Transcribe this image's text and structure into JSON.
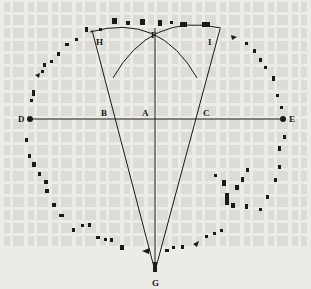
{
  "diagram": {
    "type": "geometric construction over stone circle",
    "points": {
      "A": {
        "label": "A",
        "x": 155,
        "y": 119
      },
      "B": {
        "label": "B",
        "x": 115,
        "y": 119
      },
      "C": {
        "label": "C",
        "x": 195,
        "y": 119
      },
      "D": {
        "label": "D",
        "x": 30,
        "y": 119
      },
      "E": {
        "label": "E",
        "x": 283,
        "y": 119
      },
      "F": {
        "label": "F",
        "x": 155,
        "y": 43
      },
      "G": {
        "label": "G",
        "x": 155,
        "y": 271
      },
      "H": {
        "label": "H",
        "x": 92,
        "y": 30
      },
      "I": {
        "label": "I",
        "x": 220,
        "y": 29
      }
    },
    "colors": {
      "ink": "#1a1a1a",
      "paper": "#ecebe6"
    }
  }
}
